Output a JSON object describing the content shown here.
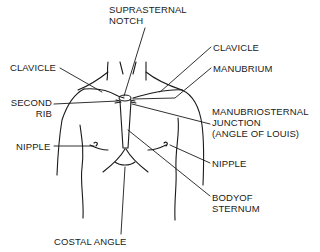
{
  "diagram": {
    "labels": {
      "suprasternal_notch": [
        "SUPRASTERNAL",
        "NOTCH"
      ],
      "clavicle_left": "CLAVICLE",
      "clavicle_right": "CLAVICLE",
      "manubrium": "MANUBRIUM",
      "second_rib": [
        "SECOND",
        "RIB"
      ],
      "manubriosternal_junction": [
        "MANUBRIOSTERNAL",
        "JUNCTION",
        "(ANGLE OF LOUIS)"
      ],
      "nipple_left": "NIPPLE",
      "nipple_right": "NIPPLE",
      "body_of_sternum": [
        "BODYOF",
        "STERNUM"
      ],
      "costal_angle": "COSTAL ANGLE"
    },
    "colors": {
      "line": "#1a1a1a",
      "background": "#ffffff"
    }
  }
}
